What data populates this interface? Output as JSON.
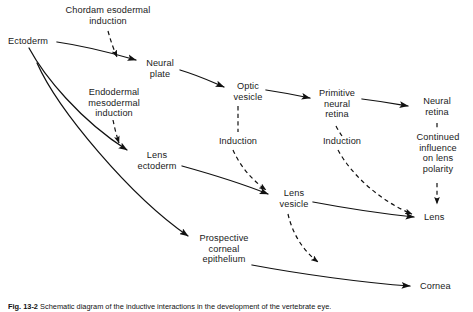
{
  "figure": {
    "type": "flow-diagram",
    "caption_prefix": "Fig. 13-2",
    "caption_text": "Schematic diagram of the inductive interactions in the development of the vertebrate eye."
  },
  "nodes": [
    {
      "id": "ectoderm",
      "label": "Ectoderm",
      "x": 8,
      "y": 36,
      "align": "left",
      "interactable": false
    },
    {
      "id": "chordamesodermal-induction",
      "label": "Chordam esodermal\ninduction",
      "x": 59,
      "y": 5,
      "align": "center",
      "interactable": false
    },
    {
      "id": "neural-plate",
      "label": "Neural\nplate",
      "x": 143,
      "y": 58,
      "align": "center",
      "interactable": false
    },
    {
      "id": "endodermal-mesodermal-induction",
      "label": "Endodermal\nmesodermal\ninduction",
      "x": 78,
      "y": 87,
      "align": "center",
      "interactable": false
    },
    {
      "id": "optic-vesicle",
      "label": "Optic\nvesicle",
      "x": 231,
      "y": 81,
      "align": "center",
      "interactable": false
    },
    {
      "id": "primitive-neural-retina",
      "label": "Primitive\nneural\nretina",
      "x": 320,
      "y": 91,
      "align": "center",
      "interactable": false
    },
    {
      "id": "neural-retina",
      "label": "Neural\nretina",
      "x": 417,
      "y": 101,
      "align": "center",
      "interactable": false
    },
    {
      "id": "induction-1",
      "label": "Induction",
      "x": 218,
      "y": 139,
      "align": "center",
      "interactable": false
    },
    {
      "id": "induction-2",
      "label": "Induction",
      "x": 322,
      "y": 139,
      "align": "center",
      "interactable": false
    },
    {
      "id": "continued-influence",
      "label": "Continued\ninfluence\non lens\npolarity",
      "x": 416,
      "y": 133,
      "align": "center",
      "interactable": false
    },
    {
      "id": "lens-ectoderm",
      "label": "Lens\nectoderm",
      "x": 136,
      "y": 152,
      "align": "center",
      "interactable": false
    },
    {
      "id": "lens-vesicle",
      "label": "Lens\nvesicle",
      "x": 278,
      "y": 189,
      "align": "center",
      "interactable": false
    },
    {
      "id": "lens",
      "label": "Lens",
      "x": 424,
      "y": 212,
      "align": "left",
      "interactable": false
    },
    {
      "id": "prospective-corneal-epithelium",
      "label": "Prospective\ncorneal\nepithelium",
      "x": 196,
      "y": 233,
      "align": "center",
      "interactable": false
    },
    {
      "id": "cornea",
      "label": "Cornea",
      "x": 420,
      "y": 281,
      "align": "left",
      "interactable": false
    }
  ],
  "edges": [
    {
      "id": "ectoderm-to-neural-plate",
      "style": "solid",
      "from": "ectoderm",
      "to": "neural-plate"
    },
    {
      "id": "ectoderm-to-lens-ectoderm",
      "style": "solid",
      "from": "ectoderm",
      "to": "lens-ectoderm"
    },
    {
      "id": "ectoderm-to-prospective-corneal-epithelium",
      "style": "solid",
      "from": "ectoderm",
      "to": "prospective-corneal-epithelium"
    },
    {
      "id": "chordamesoderm-to-neural-plate",
      "style": "dashed",
      "from": "chordamesodermal-induction",
      "to": "neural-plate"
    },
    {
      "id": "endoderm-mesoderm-to-lens-ectoderm",
      "style": "dashed",
      "from": "endodermal-mesodermal-induction",
      "to": "lens-ectoderm"
    },
    {
      "id": "neural-plate-to-optic-vesicle",
      "style": "solid",
      "from": "neural-plate",
      "to": "optic-vesicle"
    },
    {
      "id": "optic-vesicle-to-primitive-neural-retina",
      "style": "solid",
      "from": "optic-vesicle",
      "to": "primitive-neural-retina"
    },
    {
      "id": "primitive-neural-retina-to-neural-retina",
      "style": "solid",
      "from": "primitive-neural-retina",
      "to": "neural-retina"
    },
    {
      "id": "optic-vesicle-to-induction-1",
      "style": "dashed",
      "from": "optic-vesicle",
      "to": "induction-1"
    },
    {
      "id": "induction-1-to-lens-vesicle",
      "style": "dashed",
      "from": "induction-1",
      "to": "lens-vesicle"
    },
    {
      "id": "primitive-neural-retina-to-induction-2",
      "style": "dashed",
      "from": "primitive-neural-retina",
      "to": "induction-2"
    },
    {
      "id": "induction-2-to-lens",
      "style": "dashed",
      "from": "induction-2",
      "to": "lens"
    },
    {
      "id": "neural-retina-to-continued-influence",
      "style": "dashed",
      "from": "neural-retina",
      "to": "continued-influence"
    },
    {
      "id": "continued-influence-to-lens",
      "style": "dashed",
      "from": "continued-influence",
      "to": "lens"
    },
    {
      "id": "lens-ectoderm-to-lens-vesicle",
      "style": "solid",
      "from": "lens-ectoderm",
      "to": "lens-vesicle"
    },
    {
      "id": "lens-vesicle-to-lens",
      "style": "solid",
      "from": "lens-vesicle",
      "to": "lens"
    },
    {
      "id": "lens-vesicle-to-cornea-induction",
      "style": "dashed",
      "from": "lens-vesicle",
      "to": "cornea"
    },
    {
      "id": "prospective-corneal-epithelium-to-cornea",
      "style": "solid",
      "from": "prospective-corneal-epithelium",
      "to": "cornea"
    }
  ],
  "colors": {
    "ink": "#1a1a1a",
    "background": "#ffffff"
  }
}
